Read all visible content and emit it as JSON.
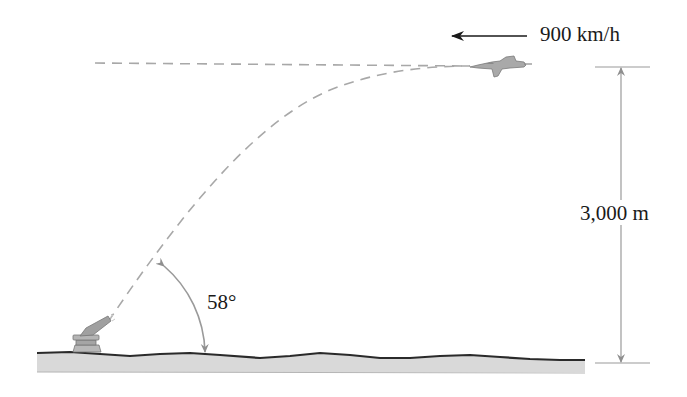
{
  "diagram": {
    "type": "projectile-intercept",
    "elements": {
      "jet": {
        "label": "jet aircraft",
        "direction": "left"
      },
      "cannon": {
        "label": "anti-aircraft gun"
      },
      "ground": {
        "label": "ground"
      }
    },
    "labels": {
      "speed": "900 km/h",
      "height": "3,000 m",
      "angle": "58°"
    },
    "colors": {
      "dash": "#a8a8a8",
      "dimension": "#9a9a9a",
      "ground_fill": "#d9d9d9",
      "ground_edge": "#2a2a2a",
      "aircraft": "#a9a9a9",
      "text": "#1a1a1a"
    }
  }
}
